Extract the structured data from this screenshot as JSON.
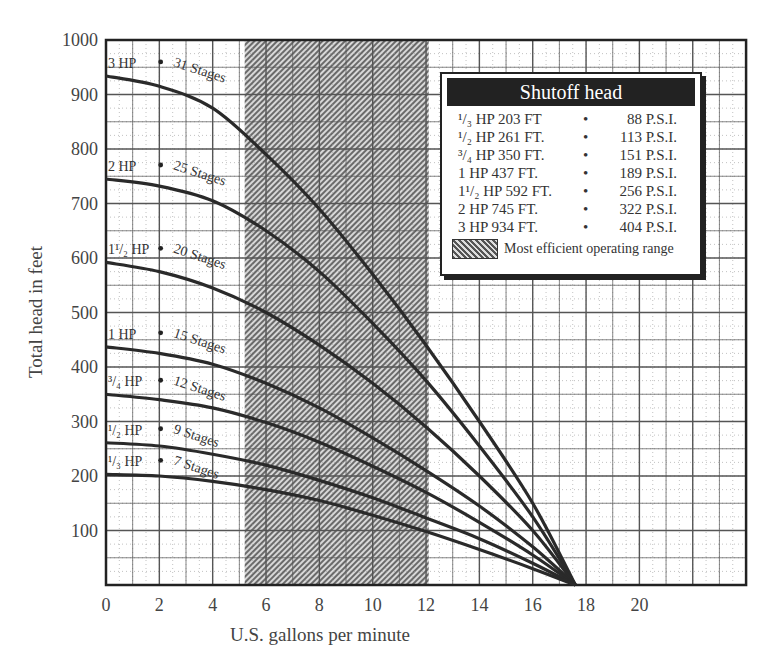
{
  "chart_data": {
    "type": "line",
    "title": "",
    "xlabel": "U.S. gallons per minute",
    "ylabel": "Total head in feet",
    "xlim": [
      0,
      24
    ],
    "ylim": [
      0,
      1000
    ],
    "x_ticks": [
      "0",
      "2",
      "4",
      "6",
      "8",
      "10",
      "12",
      "14",
      "16",
      "18",
      "20"
    ],
    "y_ticks": [
      "100",
      "200",
      "300",
      "400",
      "500",
      "600",
      "700",
      "800",
      "900",
      "1000"
    ],
    "grid": true,
    "shaded_range": {
      "x_from": 5.2,
      "x_to": 12.1,
      "label": "Most efficient operating range"
    },
    "x": [
      0,
      2,
      4,
      6,
      8,
      10,
      12,
      14,
      16,
      17.6
    ],
    "series": [
      {
        "name": "3 HP",
        "stages": "31 Stages",
        "values": [
          934,
          915,
          875,
          790,
          690,
          570,
          440,
          300,
          150,
          0
        ]
      },
      {
        "name": "2 HP",
        "stages": "25 Stages",
        "values": [
          745,
          732,
          705,
          650,
          575,
          480,
          375,
          255,
          125,
          0
        ]
      },
      {
        "name": "1 1/2 HP",
        "stages": "20 Stages",
        "values": [
          592,
          575,
          545,
          500,
          440,
          370,
          290,
          200,
          100,
          0
        ]
      },
      {
        "name": "1 HP",
        "stages": "15 Stages",
        "values": [
          437,
          425,
          405,
          370,
          325,
          270,
          210,
          145,
          70,
          0
        ]
      },
      {
        "name": "3/4 HP",
        "stages": "12 Stages",
        "values": [
          350,
          340,
          325,
          298,
          262,
          218,
          170,
          115,
          55,
          0
        ]
      },
      {
        "name": "1/2 HP",
        "stages": "9 Stages",
        "values": [
          261,
          255,
          240,
          220,
          192,
          160,
          123,
          85,
          40,
          0
        ]
      },
      {
        "name": "1/3 HP",
        "stages": "7 Stages",
        "values": [
          203,
          200,
          190,
          175,
          155,
          128,
          98,
          65,
          30,
          0
        ]
      }
    ],
    "legend": {
      "title": "Shutoff head",
      "position": "upper-right",
      "rows": [
        {
          "hp": "1/3 HP 203 FT",
          "psi": "88 P.S.I."
        },
        {
          "hp": "1/2 HP 261 FT.",
          "psi": "113 P.S.I."
        },
        {
          "hp": "3/4 HP 350 FT.",
          "psi": "151 P.S.I."
        },
        {
          "hp": "1 HP 437 FT.",
          "psi": "189 P.S.I."
        },
        {
          "hp": "1 1/2 HP 592 FT.",
          "psi": "256 P.S.I."
        },
        {
          "hp": "2 HP 745 FT.",
          "psi": "322 P.S.I."
        },
        {
          "hp": "3 HP 934 FT.",
          "psi": "404 P.S.I."
        }
      ]
    }
  },
  "legend_display": {
    "title": "Shutoff head",
    "rows": [
      {
        "hp": "¹/₃ HP 203 FT",
        "dot": "•",
        "psi": "88 P.S.I."
      },
      {
        "hp": "¹/₂ HP 261 FT.",
        "dot": "•",
        "psi": "113 P.S.I."
      },
      {
        "hp": "³/₄ HP 350 FT.",
        "dot": "•",
        "psi": "151 P.S.I."
      },
      {
        "hp": "1 HP 437 FT.",
        "dot": "•",
        "psi": "189 P.S.I."
      },
      {
        "hp": "1¹/₂ HP 592 FT.",
        "dot": "•",
        "psi": "256 P.S.I."
      },
      {
        "hp": "2 HP 745 FT.",
        "dot": "•",
        "psi": "322 P.S.I."
      },
      {
        "hp": "3 HP 934 FT.",
        "dot": "•",
        "psi": "404 P.S.I."
      }
    ],
    "range_label": "Most efficient operating range"
  },
  "curve_labels": [
    {
      "hp": "3 HP",
      "stages": "31 Stages"
    },
    {
      "hp": "2 HP",
      "stages": "25 Stages"
    },
    {
      "hp": "1¹/₂ HP",
      "stages": "20 Stages"
    },
    {
      "hp": "1 HP",
      "stages": "15 Stages"
    },
    {
      "hp": "³/₄ HP",
      "stages": "12 Stages"
    },
    {
      "hp": "¹/₂ HP",
      "stages": "9 Stages"
    },
    {
      "hp": "¹/₃ HP",
      "stages": "7 Stages"
    }
  ]
}
